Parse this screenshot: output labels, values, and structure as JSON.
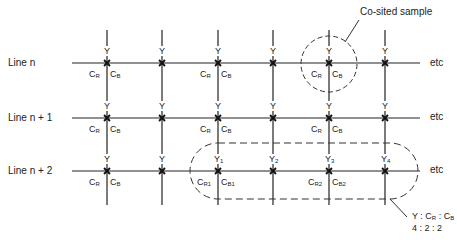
{
  "diagram": {
    "title_annotation": "Co-sited sample",
    "lines": [
      {
        "label": "Line n",
        "end_label": "etc"
      },
      {
        "label": "Line n + 1",
        "end_label": "etc"
      },
      {
        "label": "Line n + 2",
        "end_label": "etc"
      }
    ],
    "sample_symbols": {
      "luma": "Y",
      "chroma_r": "C",
      "chroma_r_sub": "R",
      "chroma_b": "C",
      "chroma_b_sub": "B"
    },
    "numbered_luma": [
      {
        "base": "Y",
        "sub": "1"
      },
      {
        "base": "Y",
        "sub": "2"
      },
      {
        "base": "Y",
        "sub": "3"
      },
      {
        "base": "Y",
        "sub": "4"
      }
    ],
    "numbered_chroma": [
      {
        "r_base": "C",
        "r_sub": "R1",
        "b_base": "C",
        "b_sub": "B1"
      },
      {
        "r_base": "C",
        "r_sub": "R2",
        "b_base": "C",
        "b_sub": "B2"
      }
    ],
    "ratio_label": {
      "line1_prefix": "Y : C",
      "line1_r": "R",
      "line1_sep": " : C",
      "line1_b": "B",
      "line2": "4 : 2 : 2"
    }
  }
}
